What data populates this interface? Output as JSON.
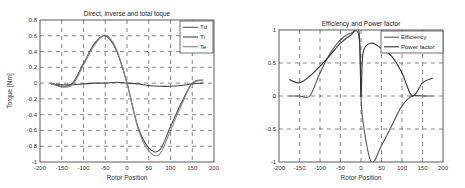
{
  "chart_data": [
    {
      "type": "line",
      "title": "Direct, inverse and total toque",
      "xlabel": "Rotor Position",
      "ylabel": "Torque [Nm]",
      "xlim": [
        -200,
        200
      ],
      "ylim": [
        -1,
        0.8
      ],
      "xticks": [
        -200,
        -150,
        -100,
        -50,
        0,
        50,
        100,
        150,
        200
      ],
      "yticks": [
        0.8,
        0.6,
        0.4,
        0.2,
        0,
        -0.2,
        -0.4,
        -0.6,
        -0.8,
        -1
      ],
      "grid": true,
      "legend_position": "upper right",
      "x": [
        -175,
        -150,
        -125,
        -100,
        -75,
        -50,
        -25,
        0,
        25,
        50,
        75,
        100,
        125,
        150,
        175
      ],
      "series": [
        {
          "name": "Td",
          "color": "#555555",
          "values": [
            0.0,
            -0.04,
            0.0,
            0.25,
            0.5,
            0.6,
            0.42,
            0.0,
            -0.55,
            -0.82,
            -0.85,
            -0.55,
            -0.25,
            0.0,
            0.04
          ]
        },
        {
          "name": "Ti",
          "color": "#444444",
          "values": [
            -0.01,
            -0.02,
            -0.02,
            -0.01,
            0.0,
            0.0,
            0.01,
            0.0,
            -0.01,
            -0.03,
            -0.04,
            -0.04,
            -0.03,
            -0.01,
            0.0
          ]
        },
        {
          "name": "Te",
          "color": "#888888",
          "values": [
            0.0,
            -0.05,
            -0.02,
            0.23,
            0.48,
            0.61,
            0.44,
            0.0,
            -0.57,
            -0.86,
            -0.9,
            -0.6,
            -0.28,
            0.0,
            0.03
          ]
        }
      ]
    },
    {
      "type": "line",
      "title": "Efficiency and Power factor",
      "xlabel": "Rotor Position",
      "ylabel": "",
      "xlim": [
        -200,
        200
      ],
      "ylim": [
        -1,
        1
      ],
      "xticks": [
        -200,
        -150,
        -100,
        -50,
        0,
        50,
        100,
        150,
        200
      ],
      "yticks": [
        1,
        0.5,
        0,
        -0.5,
        -1
      ],
      "grid": true,
      "legend_position": "upper right",
      "x": [
        -175,
        -150,
        -125,
        -100,
        -75,
        -50,
        -25,
        -5,
        0,
        5,
        25,
        50,
        75,
        100,
        125,
        150,
        175
      ],
      "series": [
        {
          "name": "Efficiency",
          "color": "#555555",
          "values": [
            0.0,
            0.0,
            0.0,
            0.35,
            0.65,
            0.85,
            0.95,
            0.9,
            0.0,
            -0.4,
            -1.0,
            -0.75,
            -0.45,
            -0.15,
            0.0,
            0.0,
            0.0
          ]
        },
        {
          "name": "Power factor",
          "color": "#333333",
          "values": [
            0.25,
            0.2,
            0.3,
            0.45,
            0.62,
            0.8,
            0.92,
            0.97,
            0.0,
            0.65,
            0.8,
            0.72,
            0.6,
            0.35,
            0.0,
            0.2,
            0.27
          ]
        }
      ]
    }
  ]
}
